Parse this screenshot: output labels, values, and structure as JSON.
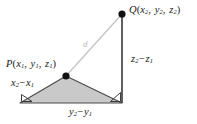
{
  "figure": {
    "kind": "distance-formula-3d-diagram",
    "canvas": {
      "width": 197,
      "height": 124
    },
    "colors": {
      "background": "#ffffff",
      "triangle_fill": "#c9c9c9",
      "triangle_stroke": "#4a4a4a",
      "vertical_line": "#2b2b2b",
      "hypotenuse": "#c4c4c4",
      "point_dot": "#111111",
      "label_text": "#1b1b1b",
      "d_label_text": "#b9b9b9"
    },
    "points": [
      {
        "id": "Q",
        "name": "point-q",
        "cx": 122,
        "cy": 14,
        "r": 3.6
      },
      {
        "id": "P",
        "name": "point-p",
        "cx": 66,
        "cy": 76,
        "r": 3.6
      }
    ],
    "vertices": {
      "p": {
        "x": 66,
        "y": 76
      },
      "q": {
        "x": 122,
        "y": 14
      },
      "bottom_left": {
        "x": 20,
        "y": 103
      },
      "bottom_right": {
        "x": 122,
        "y": 103
      }
    },
    "shapes": {
      "base_triangle_points": "66,76 20,103 122,103",
      "vertical_leg": {
        "x1": 122,
        "y1": 14,
        "x2": 122,
        "y2": 103
      },
      "hypotenuse": {
        "x1": 66,
        "y1": 76,
        "x2": 122,
        "y2": 14
      },
      "right_angle_marks": [
        {
          "name": "right-angle-mark-bottom-left",
          "points": "20,103 32,103 20,95"
        },
        {
          "name": "right-angle-mark-bottom-right",
          "points": "122,103 110,103 122,92"
        }
      ]
    }
  },
  "labels": {
    "q_point": {
      "text": "Q(x2, y2, z2)",
      "letter": "Q",
      "open": "(",
      "terms": [
        {
          "base": "x",
          "sub": "2"
        },
        {
          "base": "y",
          "sub": "2"
        },
        {
          "base": "z",
          "sub": "2"
        }
      ],
      "close": ")"
    },
    "p_point": {
      "text": "P(x1, y1, z1)",
      "letter": "P",
      "open": "(",
      "terms": [
        {
          "base": "x",
          "sub": "1"
        },
        {
          "base": "y",
          "sub": "1"
        },
        {
          "base": "z",
          "sub": "1"
        }
      ],
      "close": ")"
    },
    "delta_x": {
      "text": "x2 - x1",
      "left_base": "x",
      "left_sub": "2",
      "operator": "−",
      "right_base": "x",
      "right_sub": "1"
    },
    "delta_y": {
      "text": "y2 - y1",
      "left_base": "y",
      "left_sub": "2",
      "operator": "−",
      "right_base": "y",
      "right_sub": "1"
    },
    "delta_z": {
      "text": "z2 - z1",
      "left_base": "z",
      "left_sub": "2",
      "operator": "−",
      "right_base": "z",
      "right_sub": "1"
    },
    "distance": {
      "text": "d"
    }
  }
}
